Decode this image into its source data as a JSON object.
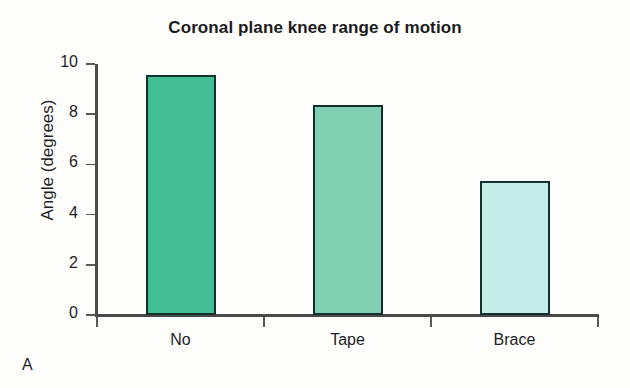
{
  "chart_data": {
    "type": "bar",
    "title": "Coronal plane knee range of motion",
    "xlabel": "",
    "ylabel": "Angle (degrees)",
    "categories": [
      "No",
      "Tape",
      "Brace"
    ],
    "values": [
      9.55,
      8.35,
      5.35
    ],
    "ylim": [
      0,
      10
    ],
    "yticks": [
      0,
      2,
      4,
      6,
      8,
      10
    ],
    "ytick_labels": [
      "0",
      "2",
      "4",
      "6",
      "8",
      "10"
    ],
    "grid": false,
    "legend": "none",
    "bar_colors": [
      "#41be94",
      "#82d0b4",
      "#c5ede8"
    ],
    "bar_edge_color": "#12312c",
    "axis_color": "#4a4a4a",
    "text_color": "#1f1f1f",
    "background": "#fdfdfc",
    "panel_label": "A"
  }
}
